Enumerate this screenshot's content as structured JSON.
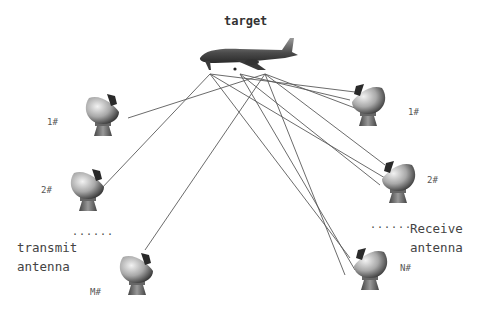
{
  "diagram": {
    "target": {
      "label": "target",
      "icon": "airplane-icon"
    },
    "transmit_group": {
      "label_line1": "transmit",
      "label_line2": "antenna",
      "ellipsis": "......",
      "antennas": [
        {
          "id": "tx1",
          "label": "1#"
        },
        {
          "id": "tx2",
          "label": "2#"
        },
        {
          "id": "txM",
          "label": "M#"
        }
      ]
    },
    "receive_group": {
      "label_line1": "Receive",
      "label_line2": "antenna",
      "ellipsis": "......",
      "antennas": [
        {
          "id": "rx1",
          "label": "1#"
        },
        {
          "id": "rx2",
          "label": "2#"
        },
        {
          "id": "rxN",
          "label": "N#"
        }
      ]
    },
    "colors": {
      "line": "#555555",
      "antenna_dark": "#3a3a3a",
      "antenna_light": "#d8d8d8",
      "text": "#3a3a3a"
    }
  }
}
